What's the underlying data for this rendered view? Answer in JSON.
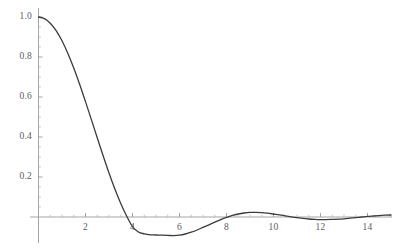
{
  "chart_data": {
    "type": "line",
    "title": "",
    "subtitle": "",
    "xlabel": "",
    "ylabel": "",
    "xlim": [
      -0.2,
      15.2
    ],
    "ylim": [
      -0.12,
      1.05
    ],
    "grid": false,
    "legend": null,
    "legend_position": "none",
    "axis_style": "mathematica-cross-axes",
    "line_color": "#3b3b3b",
    "axis_color": "#9b9b9b",
    "background_color": "#ffffff",
    "line_width": 1.3,
    "x_ticks_major": [
      2,
      4,
      6,
      8,
      10,
      12,
      14
    ],
    "x_tick_labels": [
      "2",
      "4",
      "6",
      "8",
      "10",
      "12",
      "14"
    ],
    "x_ticks_minor": [
      0.5,
      1,
      1.5,
      2.5,
      3,
      3.5,
      4.5,
      5,
      5.5,
      6.5,
      7,
      7.5,
      8.5,
      9,
      9.5,
      10.5,
      11,
      11.5,
      12.5,
      13,
      13.5,
      14.5,
      15
    ],
    "y_ticks_major": [
      0.2,
      0.4,
      0.6,
      0.8,
      1.0
    ],
    "y_tick_labels": [
      "0.2",
      "0.4",
      "0.6",
      "0.8",
      "1.0"
    ],
    "y_ticks_minor": [
      0.05,
      0.1,
      0.15,
      0.25,
      0.3,
      0.35,
      0.45,
      0.5,
      0.55,
      0.65,
      0.7,
      0.75,
      0.85,
      0.9,
      0.95
    ],
    "series": [
      {
        "name": "damped oscillation",
        "x": [
          0,
          0.25,
          0.5,
          0.75,
          1,
          1.25,
          1.5,
          1.75,
          2,
          2.25,
          2.5,
          2.75,
          3,
          3.25,
          3.5,
          3.75,
          4,
          4.25,
          4.5,
          4.75,
          5,
          5.25,
          5.5,
          5.75,
          6,
          6.25,
          6.5,
          6.75,
          7,
          7.25,
          7.5,
          7.75,
          8,
          8.25,
          8.5,
          8.75,
          9,
          9.25,
          9.5,
          9.75,
          10,
          10.25,
          10.5,
          10.75,
          11,
          11.25,
          11.5,
          11.75,
          12,
          12.25,
          12.5,
          12.75,
          13,
          13.25,
          13.5,
          13.75,
          14,
          14.25,
          14.5,
          14.75,
          15
        ],
        "y": [
          1.0,
          0.992,
          0.969,
          0.932,
          0.881,
          0.818,
          0.745,
          0.664,
          0.577,
          0.487,
          0.396,
          0.306,
          0.22,
          0.14,
          0.068,
          0.005,
          -0.048,
          -0.075,
          -0.084,
          -0.089,
          -0.09,
          -0.091,
          -0.092,
          -0.093,
          -0.091,
          -0.085,
          -0.076,
          -0.065,
          -0.052,
          -0.039,
          -0.026,
          -0.013,
          -0.002,
          0.008,
          0.015,
          0.02,
          0.023,
          0.023,
          0.022,
          0.019,
          0.015,
          0.011,
          0.006,
          0.001,
          -0.003,
          -0.007,
          -0.01,
          -0.012,
          -0.013,
          -0.013,
          -0.012,
          -0.011,
          -0.009,
          -0.006,
          -0.003,
          0.0,
          0.003,
          0.005,
          0.007,
          0.009,
          0.01
        ]
      }
    ],
    "annotations": {
      "zero_crossing_1": 3.77,
      "local_minimum": {
        "x": 5.75,
        "y": -0.093
      },
      "zero_crossing_2": 8.05,
      "local_maximum": {
        "x": 9.1,
        "y": 0.023
      },
      "zero_crossing_3": 10.85,
      "local_minimum_2": {
        "x": 12.1,
        "y": -0.013
      }
    }
  },
  "axes": {
    "y_labels": [
      "1.0",
      "0.8",
      "0.6",
      "0.4",
      "0.2"
    ],
    "x_labels": [
      "2",
      "4",
      "6",
      "8",
      "10",
      "12",
      "14"
    ]
  }
}
